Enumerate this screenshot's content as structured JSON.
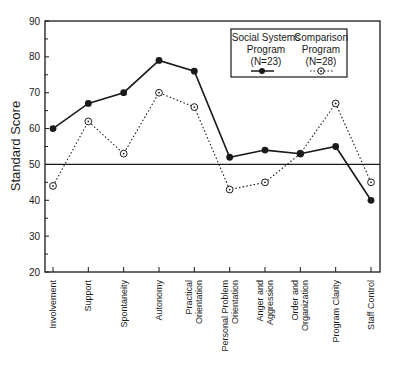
{
  "chart_data": {
    "type": "line",
    "title": "",
    "xlabel": "",
    "ylabel": "Standard Score",
    "ylim": [
      20,
      90
    ],
    "yticks": [
      20,
      30,
      40,
      50,
      60,
      70,
      80,
      90
    ],
    "reference_line": 50,
    "grid": false,
    "legend_position": "upper right (inside)",
    "categories": [
      "Involvement",
      "Support",
      "Spontaneity",
      "Autonomy",
      "Practical Orientation",
      "Personal Problem Orientation",
      "Anger and Aggression",
      "Order and Organization",
      "Program Clarity",
      "Staff Control"
    ],
    "category_label_lines": [
      [
        "Involvement"
      ],
      [
        "Support"
      ],
      [
        "Spontaneity"
      ],
      [
        "Autonomy"
      ],
      [
        "Practical",
        "Orientation"
      ],
      [
        "Personal Problem",
        "Orientation"
      ],
      [
        "Anger and",
        "Aggression"
      ],
      [
        "Order and",
        "Organization"
      ],
      [
        "Program Clarity"
      ],
      [
        "Staff Control"
      ]
    ],
    "series": [
      {
        "name": "Social Systems Program (N=23)",
        "legend_lines": [
          "Social Systems",
          "Program",
          "(N=23)"
        ],
        "style": "solid line, filled circle markers",
        "values": [
          60,
          67,
          70,
          79,
          76,
          52,
          54,
          53,
          55,
          40
        ]
      },
      {
        "name": "Comparison Program (N=28)",
        "legend_lines": [
          "Comparison",
          "Program",
          "(N=28)"
        ],
        "style": "dotted line, open circle markers",
        "values": [
          44,
          62,
          53,
          70,
          66,
          43,
          45,
          53,
          67,
          45
        ]
      }
    ]
  },
  "colors": {
    "ink": "#1a1a1a",
    "background": "#ffffff"
  }
}
